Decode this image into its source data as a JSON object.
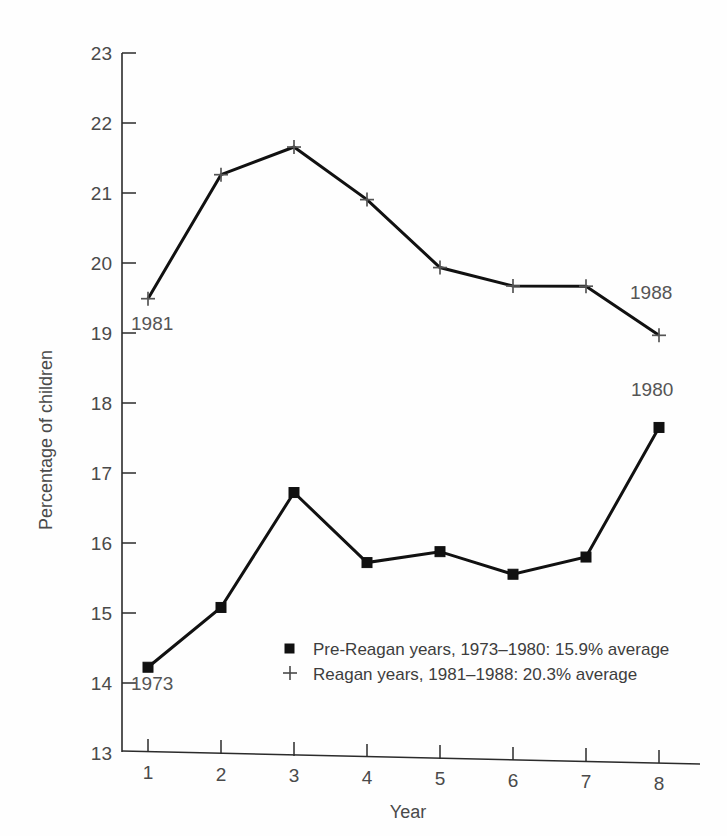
{
  "chart_data": {
    "type": "line",
    "title": "",
    "xlabel": "Year",
    "ylabel": "Percentage of children",
    "x": [
      1,
      2,
      3,
      4,
      5,
      6,
      7,
      8
    ],
    "xtick_labels": [
      "1",
      "2",
      "3",
      "4",
      "5",
      "6",
      "7",
      "8"
    ],
    "ytick_labels": [
      "13",
      "14",
      "15",
      "16",
      "17",
      "18",
      "19",
      "20",
      "21",
      "22",
      "23"
    ],
    "yticks": [
      13,
      14,
      15,
      16,
      17,
      18,
      19,
      20,
      21,
      22,
      23
    ],
    "xlim": [
      0.6,
      8.6
    ],
    "ylim": [
      13,
      23
    ],
    "grid": false,
    "legend_position": "inside-lower-center",
    "series": [
      {
        "name": "Pre-Reagan years, 1973–1980: 15.9% average",
        "marker": "square",
        "values": [
          14.2,
          15.08,
          16.75,
          15.77,
          15.95,
          15.65,
          15.92,
          17.8
        ]
      },
      {
        "name": "Reagan years, 1981–1988: 20.3% average",
        "marker": "plus",
        "values": [
          19.48,
          21.28,
          21.7,
          20.97,
          20.02,
          19.78,
          19.8,
          19.12
        ]
      }
    ],
    "annotations": [
      {
        "text": "1981",
        "series": "Reagan years",
        "point_index": 0
      },
      {
        "text": "1988",
        "series": "Reagan years",
        "point_index": 7
      },
      {
        "text": "1973",
        "series": "Pre-Reagan years",
        "point_index": 0
      },
      {
        "text": "1980",
        "series": "Pre-Reagan years",
        "point_index": 7
      }
    ],
    "colors": {
      "line": "#111111",
      "square_marker": "#111111",
      "plus_marker": "#555555",
      "axis": "#2b2b2b",
      "text": "#4a4a4a",
      "background": "#fefefe"
    }
  },
  "legend": {
    "entries": [
      {
        "marker": "square",
        "label": "Pre-Reagan years, 1973–1980: 15.9% average"
      },
      {
        "marker": "plus",
        "label": "Reagan years, 1981–1988: 20.3% average"
      }
    ]
  },
  "axes": {
    "y_title": "Percentage of children",
    "x_title": "Year",
    "y_labels": {
      "t23": "23",
      "t22": "22",
      "t21": "21",
      "t20": "20",
      "t19": "19",
      "t18": "18",
      "t17": "17",
      "t16": "16",
      "t15": "15",
      "t14": "14",
      "t13": "13"
    },
    "x_labels": {
      "x1": "1",
      "x2": "2",
      "x3": "3",
      "x4": "4",
      "x5": "5",
      "x6": "6",
      "x7": "7",
      "x8": "8"
    }
  },
  "annotations": {
    "a1981": "1981",
    "a1988": "1988",
    "a1973": "1973",
    "a1980": "1980"
  }
}
